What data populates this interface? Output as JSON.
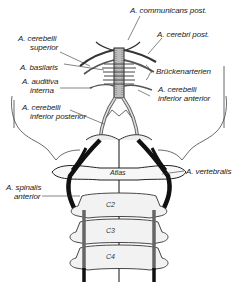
{
  "figure": {
    "type": "anatomical illustration",
    "colors": {
      "ink": "#1a1a1a",
      "background": "#ffffff",
      "bone_shade": "#e6e6e6"
    }
  },
  "labels": {
    "communicans_post": "A. communicans post.",
    "cerebri_post": "A. cerebri post.",
    "cerebelli_superior_1": "A. cerebelli",
    "cerebelli_superior_2": "superior",
    "basilaris": "A. basilaris",
    "brueckenarterien": "Brückenarterien",
    "auditiva_1": "A. auditiva",
    "auditiva_2": "interna",
    "cerebelli_inf_ant_1": "A. cerebelli",
    "cerebelli_inf_ant_2": "inferior anterior",
    "cerebelli_inf_post_1": "A. cerebelli",
    "cerebelli_inf_post_2": "inferior posterior",
    "atlas": "Atlas",
    "spinalis_1": "A. spinalis",
    "spinalis_2": "anterior",
    "vertebralis": "A. vertebralis"
  },
  "vertebrae": [
    "C2",
    "C3",
    "C4"
  ]
}
